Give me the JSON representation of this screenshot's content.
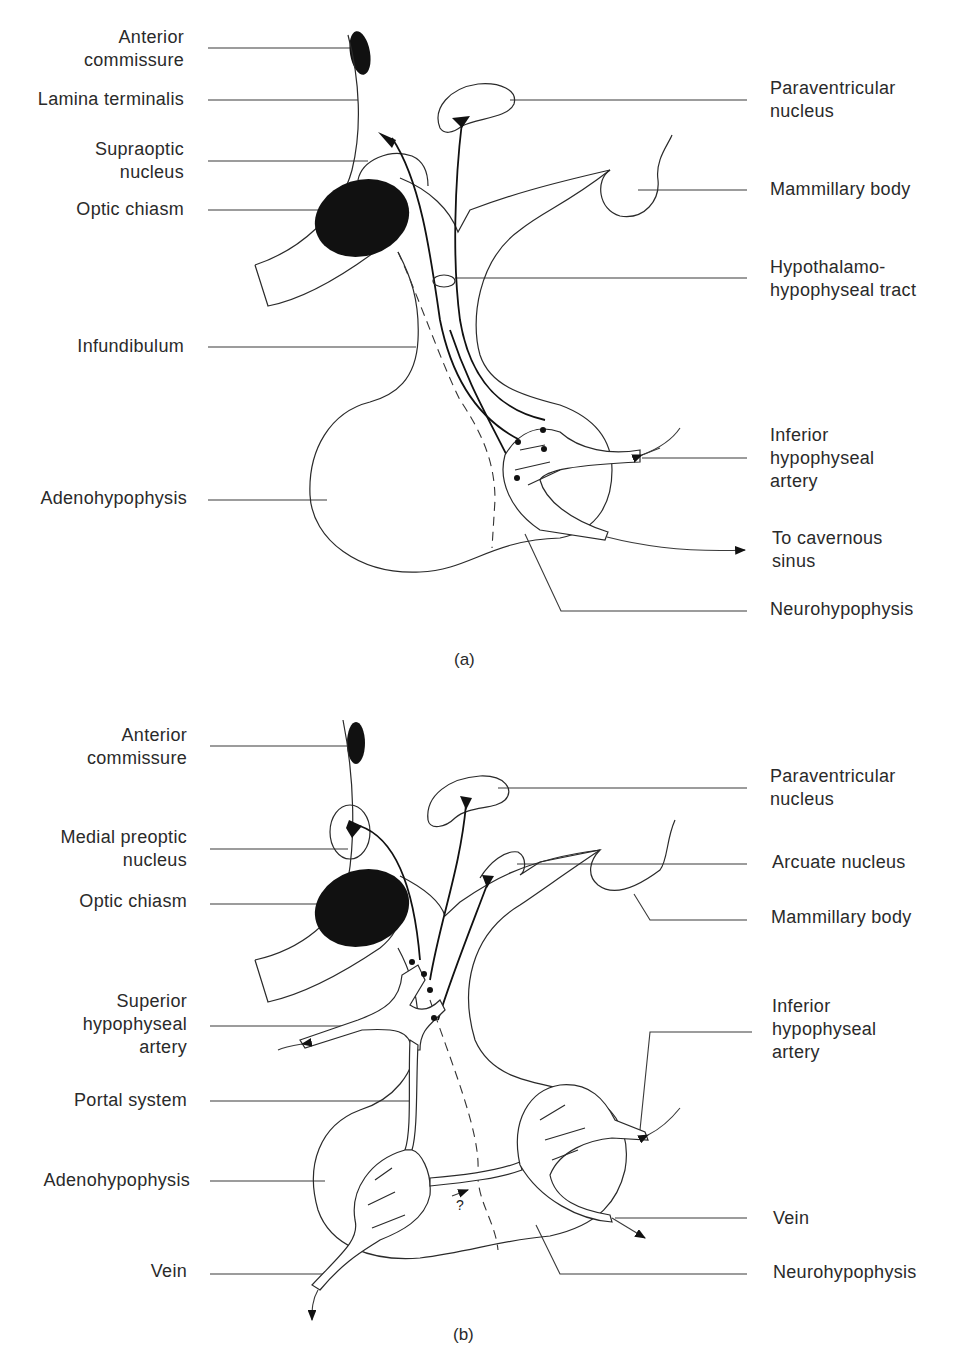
{
  "figure": {
    "panel_a": {
      "caption": "(a)",
      "left_labels": [
        {
          "line1": "Anterior",
          "line2": "commissure"
        },
        {
          "line1": "Lamina terminalis"
        },
        {
          "line1": "Supraoptic",
          "line2": "nucleus"
        },
        {
          "line1": "Optic chiasm"
        },
        {
          "line1": "Infundibulum"
        },
        {
          "line1": "Adenohypophysis"
        }
      ],
      "right_labels": [
        {
          "line1": "Paraventricular",
          "line2": "nucleus"
        },
        {
          "line1": "Mammillary body"
        },
        {
          "line1": "Hypothalamo-",
          "line2": "hypophyseal tract"
        },
        {
          "line1": "Inferior",
          "line2": "hypophyseal",
          "line3": "artery"
        },
        {
          "line1": "To cavernous",
          "line2": "sinus"
        },
        {
          "line1": "Neurohypophysis"
        }
      ]
    },
    "panel_b": {
      "caption": "(b)",
      "question_mark": "?",
      "left_labels": [
        {
          "line1": "Anterior",
          "line2": "commissure"
        },
        {
          "line1": "Medial preoptic",
          "line2": "nucleus"
        },
        {
          "line1": "Optic chiasm"
        },
        {
          "line1": "Superior",
          "line2": "hypophyseal",
          "line3": "artery"
        },
        {
          "line1": "Portal system"
        },
        {
          "line1": "Adenohypophysis"
        },
        {
          "line1": "Vein"
        }
      ],
      "right_labels": [
        {
          "line1": "Paraventricular",
          "line2": "nucleus"
        },
        {
          "line1": "Arcuate nucleus"
        },
        {
          "line1": "Mammillary body"
        },
        {
          "line1": "Inferior",
          "line2": "hypophyseal",
          "line3": "artery"
        },
        {
          "line1": "Vein"
        },
        {
          "line1": "Neurohypophysis"
        }
      ]
    }
  }
}
